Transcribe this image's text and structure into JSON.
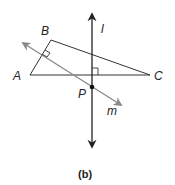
{
  "figure": {
    "caption": "(b)",
    "points": {
      "A": "A",
      "B": "B",
      "C": "C",
      "P": "P"
    },
    "lines": {
      "l": "l",
      "m": "m"
    },
    "colors": {
      "triangle": "#333333",
      "line_l": "#222222",
      "line_m": "#888888",
      "point": "#111111"
    }
  }
}
